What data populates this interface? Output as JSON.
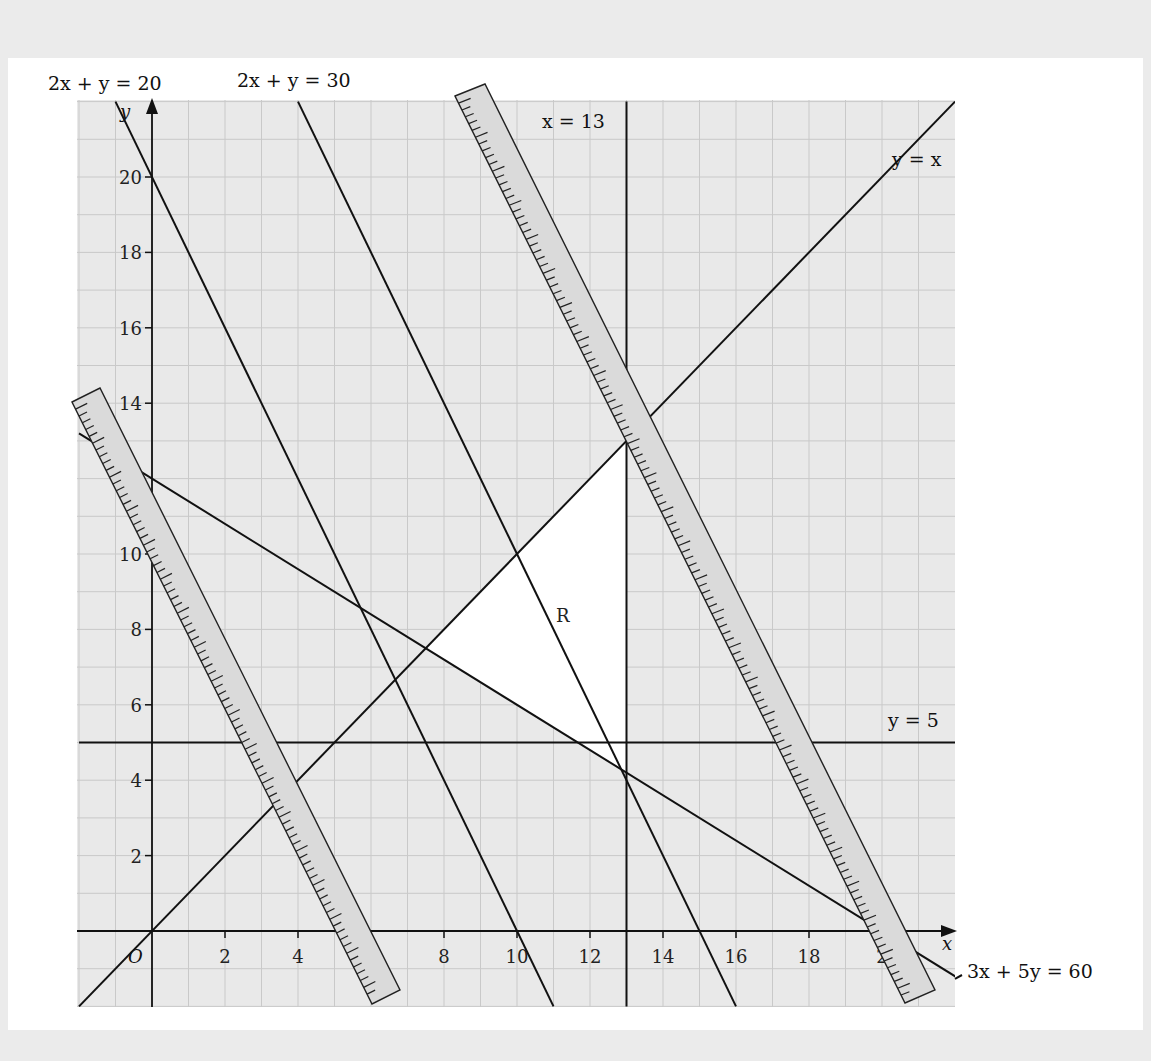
{
  "chart_data": {
    "type": "line",
    "title": "",
    "xlabel": "x",
    "ylabel": "y",
    "origin_label": "O",
    "xlim": [
      -2.1,
      22.2
    ],
    "ylim": [
      -2.0,
      22.0
    ],
    "grid": true,
    "grid_step": 1,
    "x_ticks": [
      2,
      4,
      8,
      10,
      12,
      14,
      16,
      18,
      20
    ],
    "x_tick_labels": [
      "2",
      "4",
      "8",
      "10",
      "12",
      "14",
      "16",
      "18",
      "2"
    ],
    "y_ticks": [
      2,
      4,
      6,
      8,
      10,
      14,
      16,
      18,
      20
    ],
    "y_tick_labels": [
      "2",
      "4",
      "6",
      "8",
      "10",
      "14",
      "16",
      "18",
      "20"
    ],
    "lines": [
      {
        "name": "2x + y = 20",
        "equation": "2x + y = 20",
        "points": [
          [
            -1.0,
            22.0
          ],
          [
            11.0,
            -2.0
          ]
        ]
      },
      {
        "name": "2x + y = 30",
        "equation": "2x + y = 30",
        "points": [
          [
            4.0,
            22.0
          ],
          [
            16.0,
            -2.0
          ]
        ]
      },
      {
        "name": "x = 13",
        "equation": "x = 13",
        "points": [
          [
            13.0,
            22.0
          ],
          [
            13.0,
            -2.0
          ]
        ]
      },
      {
        "name": "y = x",
        "equation": "y = x",
        "points": [
          [
            -2.0,
            -2.0
          ],
          [
            22.0,
            22.0
          ]
        ]
      },
      {
        "name": "y = 5",
        "equation": "y = 5",
        "points": [
          [
            -2.0,
            5.0
          ],
          [
            22.2,
            5.0
          ]
        ]
      },
      {
        "name": "3x + 5y = 60",
        "equation": "3x + 5y = 60",
        "points": [
          [
            -2.0,
            13.2
          ],
          [
            22.2,
            -1.32
          ]
        ]
      }
    ],
    "region": {
      "label": "R",
      "vertices": [
        [
          7.5,
          7.5
        ],
        [
          13.0,
          4.2
        ],
        [
          13.0,
          13.0
        ]
      ],
      "fill": "#ffffff",
      "label_position": [
        11.3,
        8.3
      ]
    },
    "rulers": [
      {
        "name": "left-ruler",
        "corners_px": [
          [
            72,
            402
          ],
          [
            100,
            388
          ],
          [
            400,
            990
          ],
          [
            372,
            1004
          ]
        ]
      },
      {
        "name": "right-ruler",
        "corners_px": [
          [
            455,
            96
          ],
          [
            485,
            84
          ],
          [
            935,
            990
          ],
          [
            905,
            1003
          ]
        ]
      }
    ],
    "annotations": [
      {
        "text": "2x + y = 20",
        "px": [
          48,
          90
        ]
      },
      {
        "text": "2x + y = 30",
        "px": [
          237,
          87
        ]
      },
      {
        "text": "x = 13",
        "px": [
          542,
          128
        ]
      },
      {
        "text": "y = x",
        "px": [
          892,
          166
        ]
      },
      {
        "text": "y = 5",
        "px": [
          888,
          727
        ]
      },
      {
        "text": "3x + 5y = 60",
        "px": [
          967,
          978
        ]
      },
      {
        "text": "R",
        "px": [
          556,
          622
        ]
      }
    ],
    "colors": {
      "grid_background": "#e9e9e9",
      "grid_line": "#c9c9c9",
      "line": "#111111",
      "ruler_fill": "#dadada",
      "region_fill": "#ffffff"
    }
  }
}
